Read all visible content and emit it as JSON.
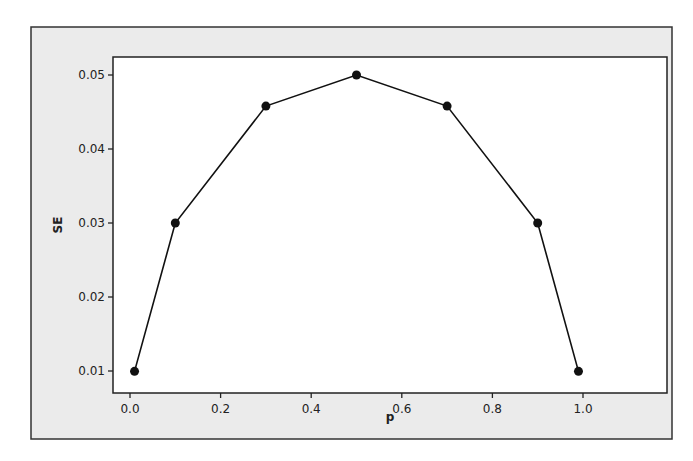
{
  "chart_data": {
    "type": "line",
    "title": "",
    "xlabel": "p",
    "ylabel": "SE",
    "x": [
      0.01,
      0.1,
      0.3,
      0.5,
      0.7,
      0.9,
      0.99
    ],
    "series": [
      {
        "name": "SE",
        "values": [
          0.00995,
          0.03,
          0.0458,
          0.05,
          0.0458,
          0.03,
          0.00995
        ],
        "marker": "circle",
        "color": "#111111"
      }
    ],
    "xticks": [
      0.0,
      0.2,
      0.4,
      0.6,
      0.8,
      1.0
    ],
    "xtick_labels": [
      "0.0",
      "0.2",
      "0.4",
      "0.6",
      "0.8",
      "1.0"
    ],
    "yticks": [
      0.01,
      0.02,
      0.03,
      0.04,
      0.05
    ],
    "ytick_labels": [
      "0.01",
      "0.02",
      "0.03",
      "0.04",
      "0.05"
    ],
    "xlim": [
      -0.037,
      1.18
    ],
    "ylim": [
      0.0072,
      0.0524
    ],
    "grid": false,
    "legend": "none"
  },
  "colors": {
    "frame_background": "#ebebeb",
    "plot_background": "#ffffff",
    "line": "#111111"
  }
}
